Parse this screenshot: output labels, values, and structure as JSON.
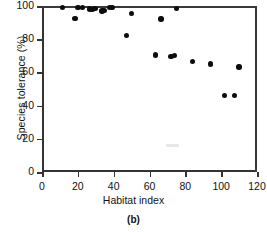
{
  "chart_data": {
    "type": "scatter",
    "title": "",
    "caption": "(b)",
    "xlabel": "Habitat index",
    "ylabel": "Species tolerance (%)",
    "xlim": [
      0,
      120
    ],
    "ylim": [
      0,
      100
    ],
    "xticks": [
      0,
      20,
      40,
      60,
      80,
      100,
      120
    ],
    "yticks": [
      0,
      20,
      40,
      60,
      80,
      100
    ],
    "grid": false,
    "legend": null,
    "marker": "filled-circle",
    "marker_color": "#0d0d0d",
    "axis_color": "#333333",
    "background": "#ffffff",
    "points": [
      {
        "x": 11.5,
        "y": 99.2
      },
      {
        "x": 18.5,
        "y": 92.3
      },
      {
        "x": 20.0,
        "y": 99.2
      },
      {
        "x": 22.5,
        "y": 99.0
      },
      {
        "x": 26.5,
        "y": 98.3
      },
      {
        "x": 28.0,
        "y": 98.0
      },
      {
        "x": 29.5,
        "y": 98.6
      },
      {
        "x": 33.5,
        "y": 97.0
      },
      {
        "x": 34.5,
        "y": 97.3
      },
      {
        "x": 37.5,
        "y": 99.0
      },
      {
        "x": 39.0,
        "y": 99.0
      },
      {
        "x": 47.0,
        "y": 82.3
      },
      {
        "x": 50.0,
        "y": 95.5
      },
      {
        "x": 63.5,
        "y": 70.5
      },
      {
        "x": 66.5,
        "y": 92.2
      },
      {
        "x": 72.0,
        "y": 69.5
      },
      {
        "x": 74.0,
        "y": 70.2
      },
      {
        "x": 75.0,
        "y": 98.5
      },
      {
        "x": 84.0,
        "y": 66.5
      },
      {
        "x": 94.0,
        "y": 65.0
      },
      {
        "x": 102.0,
        "y": 46.0
      },
      {
        "x": 107.5,
        "y": 46.0
      },
      {
        "x": 110.0,
        "y": 63.3
      }
    ]
  }
}
